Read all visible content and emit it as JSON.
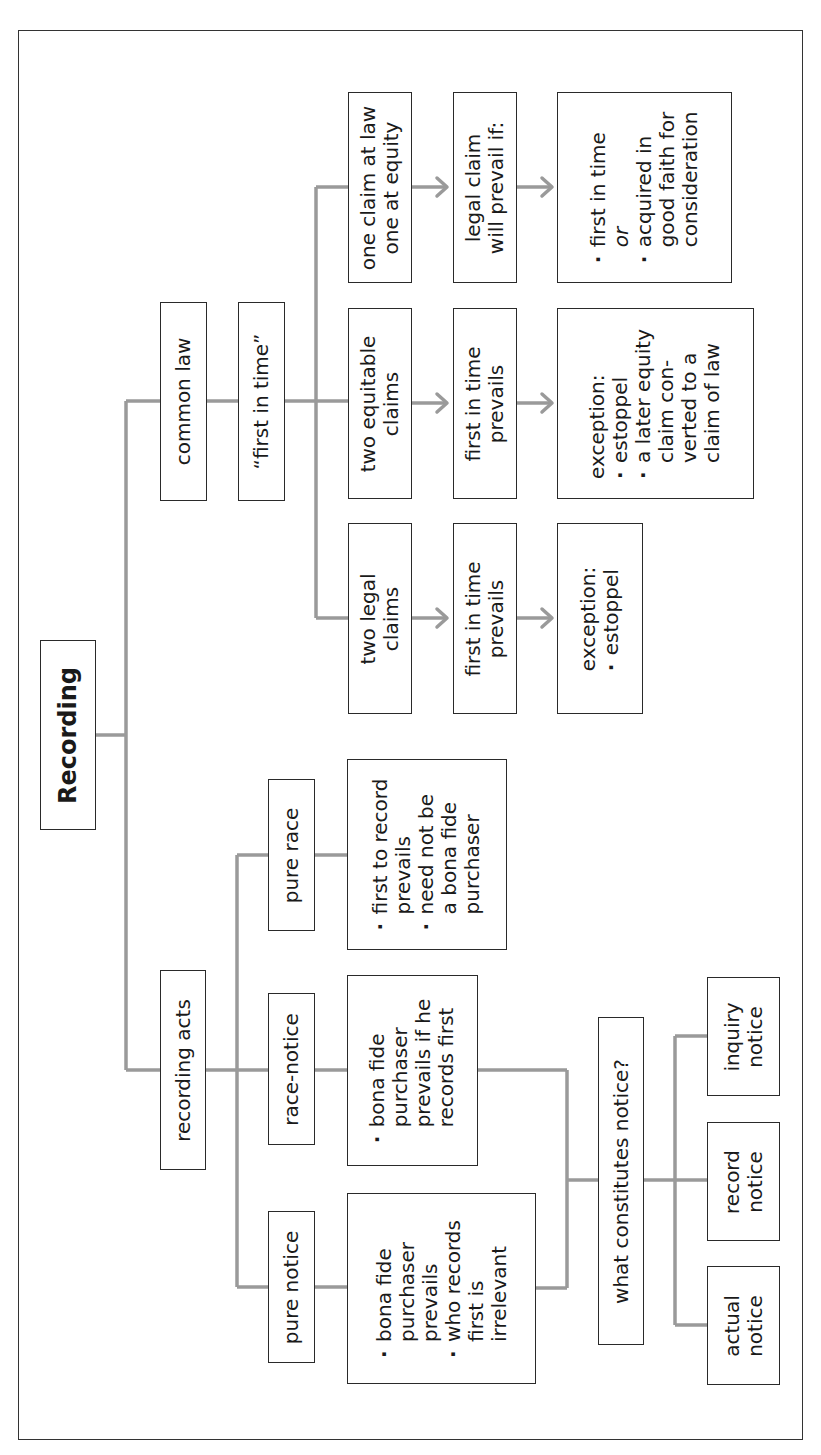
{
  "colors": {
    "line": "#9a9a9a",
    "border": "#2a2a2a",
    "text": "#1a1a1a",
    "background": "#ffffff"
  },
  "root": {
    "label": "Recording"
  },
  "common_law": {
    "label": "common law",
    "rule": "“first in time”",
    "branches": [
      {
        "claim": [
          "two legal",
          "claims"
        ],
        "result": [
          "first in time",
          "prevails"
        ],
        "detail_heading": "exception:",
        "detail_items": [
          [
            "estoppel"
          ]
        ]
      },
      {
        "claim": [
          "two equitable",
          "claims"
        ],
        "result": [
          "first in time",
          "prevails"
        ],
        "detail_heading": "exception:",
        "detail_items": [
          [
            "estoppel"
          ],
          [
            "a later equity",
            "claim con-",
            "verted to a",
            "claim of law"
          ]
        ]
      },
      {
        "claim": [
          "one claim at law",
          "one at equity"
        ],
        "result": [
          "legal claim",
          "will prevail if:"
        ],
        "detail_items": [
          [
            "first in time"
          ],
          [
            "acquired in",
            "good faith for",
            "consideration"
          ]
        ],
        "detail_separator": "or"
      }
    ]
  },
  "recording_acts": {
    "label": "recording acts",
    "types": [
      {
        "label": "pure notice",
        "rules": [
          [
            "bona fide",
            "purchaser",
            "prevails"
          ],
          [
            "who records",
            "first is",
            "irrelevant"
          ]
        ]
      },
      {
        "label": "race-notice",
        "rules": [
          [
            "bona fide",
            "purchaser",
            "prevails if he",
            "records first"
          ]
        ]
      },
      {
        "label": "pure race",
        "rules": [
          [
            "first to record",
            "prevails"
          ],
          [
            "need not be",
            "a bona fide",
            "purchaser"
          ]
        ]
      }
    ],
    "notice": {
      "question": "what constitutes notice?",
      "kinds": [
        [
          "actual",
          "notice"
        ],
        [
          "record",
          "notice"
        ],
        [
          "inquiry",
          "notice"
        ]
      ]
    }
  },
  "icons": {
    "arrow": "arrow-right-icon",
    "bullet": "bullet-dot"
  }
}
